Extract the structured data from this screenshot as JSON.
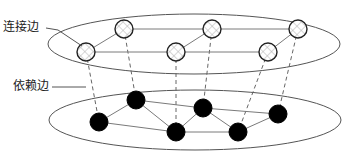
{
  "diagram": {
    "labels": {
      "connection_edge": "连接边",
      "dependency_edge": "依赖边"
    },
    "layers": [
      {
        "id": "top",
        "node_style": "hatched",
        "nodes": [
          "T1",
          "T2",
          "T3",
          "T4",
          "T5",
          "T6"
        ],
        "edges": [
          [
            "T1",
            "T2"
          ],
          [
            "T2",
            "T3"
          ],
          [
            "T3",
            "T5"
          ],
          [
            "T1",
            "T4"
          ],
          [
            "T4",
            "T6"
          ],
          [
            "T4",
            "T3"
          ],
          [
            "T6",
            "T5"
          ]
        ]
      },
      {
        "id": "bottom",
        "node_style": "filled-black",
        "nodes": [
          "B1",
          "B2",
          "B3",
          "B4",
          "B5",
          "B6"
        ],
        "edges": [
          [
            "B1",
            "B2"
          ],
          [
            "B2",
            "B3"
          ],
          [
            "B3",
            "B4"
          ],
          [
            "B4",
            "B5"
          ],
          [
            "B5",
            "B6"
          ],
          [
            "B1",
            "B3"
          ],
          [
            "B2",
            "B4"
          ],
          [
            "B4",
            "B6"
          ],
          [
            "B3",
            "B5"
          ]
        ]
      }
    ],
    "dependency_edges": [
      [
        "T1",
        "B1"
      ],
      [
        "T2",
        "B2"
      ],
      [
        "T4",
        "B3"
      ],
      [
        "T3",
        "B4"
      ],
      [
        "T6",
        "B5"
      ],
      [
        "T5",
        "B6"
      ]
    ],
    "colors": {
      "top_node_fill": "#ffffff",
      "top_node_hatch": "#b0b0b0",
      "bottom_node_fill": "#000000",
      "edge": "#7a7a7a"
    }
  }
}
